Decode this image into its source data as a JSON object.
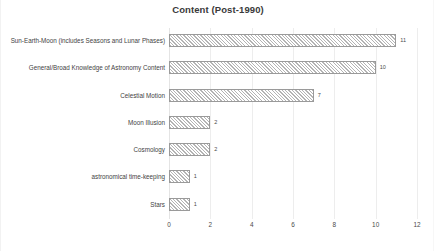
{
  "chart_data": {
    "type": "bar",
    "orientation": "horizontal",
    "title": "Content (Post-1990)",
    "xlabel": "",
    "ylabel": "",
    "xlim": [
      0,
      12
    ],
    "xticks": [
      "0",
      "2",
      "4",
      "6",
      "8",
      "10",
      "12"
    ],
    "grid": true,
    "legend": "none",
    "categories": [
      "Sun-Earth-Moon (includes Seasons and Lunar Phases)",
      "General/Broad Knowledge of Astronomy Content",
      "Celestial Motion",
      "Moon Illusion",
      "Cosmology",
      "astronomical time-keeping",
      "Stars"
    ],
    "values": [
      11,
      10,
      7,
      2,
      2,
      1,
      1
    ],
    "value_labels": [
      "11",
      "10",
      "7",
      "2",
      "2",
      "1",
      "1"
    ],
    "bar_fill": "#ffffff",
    "bar_hatch": "diagonal",
    "bar_edge_color": "#9a9a9a",
    "gridline_color": "#ededed",
    "background": "#ffffff",
    "text_color": "#3f3f3f"
  }
}
